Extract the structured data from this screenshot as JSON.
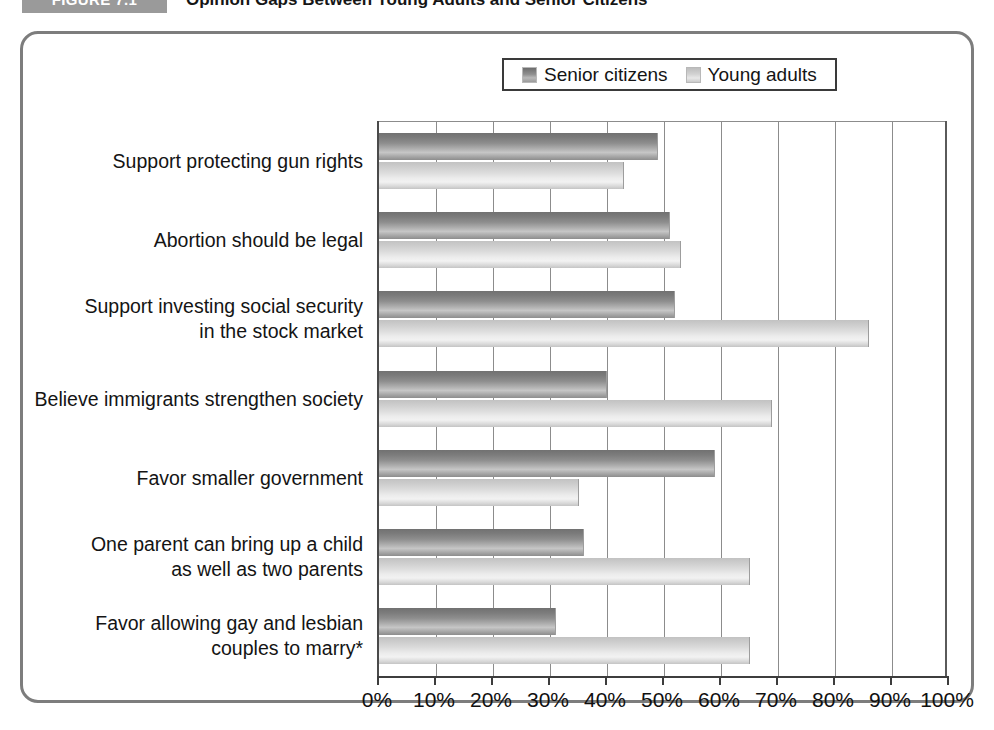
{
  "figure": {
    "badge": "FIGURE 7.1",
    "title": "Opinion Gaps Between Young Adults and Senior Citizens"
  },
  "legend": {
    "position": "top-center",
    "entries": [
      {
        "label": "Senior citizens",
        "swatch": "senior-swatch",
        "color": "#8e8e8e"
      },
      {
        "label": "Young adults",
        "swatch": "young-swatch",
        "color": "#dcdcdc"
      }
    ]
  },
  "axis": {
    "ticks": [
      "0%",
      "10%",
      "20%",
      "30%",
      "40%",
      "50%",
      "60%",
      "70%",
      "80%",
      "90%",
      "100%"
    ]
  },
  "chart_data": {
    "type": "bar",
    "orientation": "horizontal",
    "title": "Opinion Gaps Between Young Adults and Senior Citizens",
    "xlabel": "",
    "ylabel": "",
    "xlim": [
      0,
      100
    ],
    "xticks": [
      0,
      10,
      20,
      30,
      40,
      50,
      60,
      70,
      80,
      90,
      100
    ],
    "xtick_labels": [
      "0%",
      "10%",
      "20%",
      "30%",
      "40%",
      "50%",
      "60%",
      "70%",
      "80%",
      "90%",
      "100%"
    ],
    "grid": "vertical",
    "legend_position": "top-center",
    "categories": [
      "Support protecting gun rights",
      "Abortion should be legal",
      "Support investing social security in the stock market",
      "Believe immigrants strengthen society",
      "Favor smaller government",
      "One parent can bring up a child as well as two parents",
      "Favor allowing gay and lesbian couples to marry*"
    ],
    "category_lines": [
      [
        "Support protecting gun rights"
      ],
      [
        "Abortion should be legal"
      ],
      [
        "Support investing social security",
        "in the stock market"
      ],
      [
        "Believe immigrants strengthen society"
      ],
      [
        "Favor smaller government"
      ],
      [
        "One parent can bring up a child",
        "as well as two parents"
      ],
      [
        "Favor allowing gay and lesbian",
        "couples to marry*"
      ]
    ],
    "series": [
      {
        "name": "Senior citizens",
        "color": "#8e8e8e",
        "values": [
          49,
          51,
          52,
          40,
          59,
          36,
          31
        ]
      },
      {
        "name": "Young adults",
        "color": "#dcdcdc",
        "values": [
          43,
          53,
          86,
          69,
          35,
          65,
          65
        ]
      }
    ],
    "footnote": "*"
  }
}
